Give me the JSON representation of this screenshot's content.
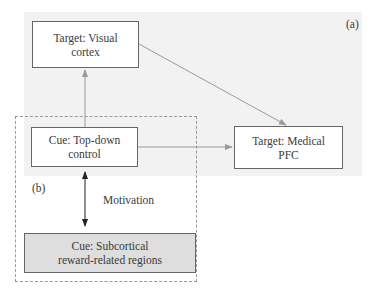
{
  "diagram": {
    "panel_labels": {
      "a": "(a)",
      "b": "(b)"
    },
    "nodes": {
      "visual_cortex": {
        "line1": "Target: Visual",
        "line2": "cortex"
      },
      "top_down": {
        "line1": "Cue: Top-down",
        "line2": "control"
      },
      "medical_pfc": {
        "line1": "Target: Medical",
        "line2": "PFC"
      },
      "subcortical": {
        "line1": "Cue: Subcortical",
        "line2": "reward-related regions"
      }
    },
    "edges": [
      {
        "from": "top_down",
        "to": "visual_cortex",
        "type": "arrow"
      },
      {
        "from": "visual_cortex",
        "to": "medical_pfc",
        "type": "arrow"
      },
      {
        "from": "top_down",
        "to": "medical_pfc",
        "type": "arrow"
      },
      {
        "from": "top_down",
        "to": "subcortical",
        "type": "bidirectional",
        "label": "Motivation"
      }
    ],
    "edge_label": "Motivation",
    "colors": {
      "panel_bg": "#f2f2f2",
      "box_border": "#666666",
      "gray_box": "#dedede",
      "arrow": "#999999",
      "bidir_arrow": "#222222"
    }
  }
}
